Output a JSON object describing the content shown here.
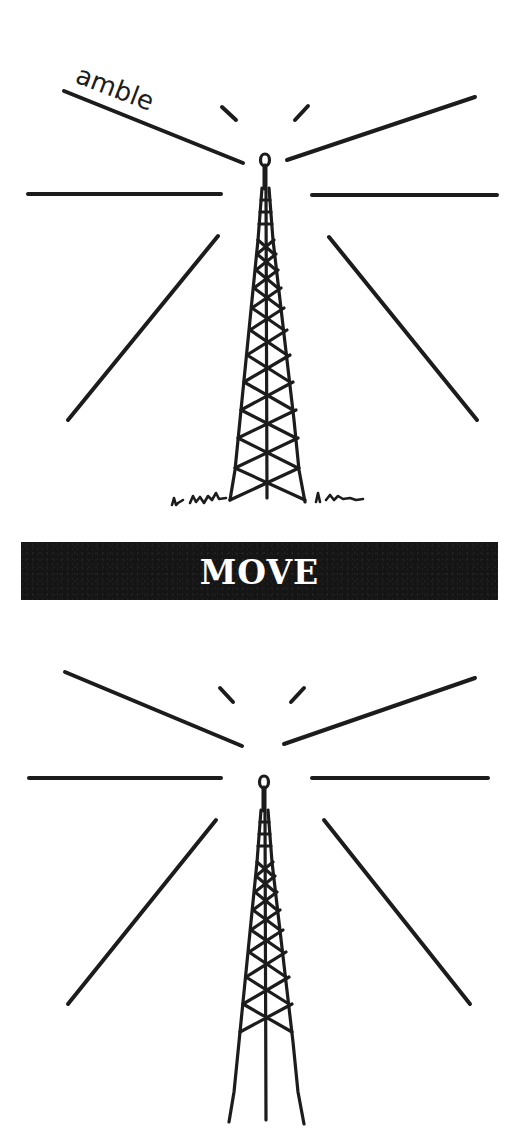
{
  "illustration": {
    "caption_handwritten": "amble",
    "banner_label": "MOVE",
    "ink_color": "#1c1c1c",
    "banner_color": "#151515",
    "banner_text_color": "#ffffff",
    "icons": [
      "radio-tower-icon",
      "radio-tower-icon"
    ]
  }
}
